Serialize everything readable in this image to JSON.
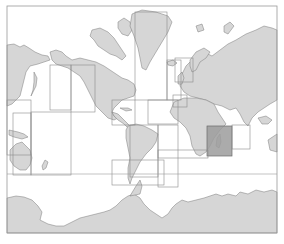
{
  "map": {
    "type": "world-chart-index",
    "projection": "mercator",
    "colors": {
      "land": "#d6d6d6",
      "coast": "#7a7a7a",
      "ocean": "#ffffff",
      "region_border": "#8a8a8a",
      "selected_region": "#9c9c9c"
    },
    "frame": {
      "x": 7,
      "y": 6,
      "w": 270,
      "h": 227
    },
    "southern_line_y": 174,
    "regions": [
      {
        "id": "north-pacific-west",
        "x": 7,
        "y": 100,
        "w": 24,
        "h": 55
      },
      {
        "id": "west-pacific",
        "x": 13,
        "y": 113,
        "w": 18,
        "h": 62
      },
      {
        "id": "north-pacific-central",
        "x": 50,
        "y": 65,
        "w": 21,
        "h": 45
      },
      {
        "id": "north-pacific-east",
        "x": 71,
        "y": 65,
        "w": 24,
        "h": 47
      },
      {
        "id": "south-pacific",
        "x": 31,
        "y": 112,
        "w": 40,
        "h": 63
      },
      {
        "id": "north-atlantic-west",
        "x": 135,
        "y": 12,
        "w": 32,
        "h": 88
      },
      {
        "id": "north-atlantic",
        "x": 167,
        "y": 60,
        "w": 14,
        "h": 40
      },
      {
        "id": "caribbean",
        "x": 112,
        "y": 100,
        "w": 23,
        "h": 25
      },
      {
        "id": "central-atlantic",
        "x": 148,
        "y": 100,
        "w": 30,
        "h": 24
      },
      {
        "id": "south-atlantic",
        "x": 158,
        "y": 125,
        "w": 20,
        "h": 62
      },
      {
        "id": "south-america-east",
        "x": 130,
        "y": 125,
        "w": 28,
        "h": 52
      },
      {
        "id": "south-america-south",
        "x": 112,
        "y": 160,
        "w": 52,
        "h": 25
      },
      {
        "id": "north-sea",
        "x": 175,
        "y": 58,
        "w": 18,
        "h": 24
      },
      {
        "id": "mediterranean-west",
        "x": 173,
        "y": 95,
        "w": 14,
        "h": 12
      },
      {
        "id": "indian-ocean-west",
        "x": 207,
        "y": 126,
        "w": 25,
        "h": 30,
        "selected": true
      },
      {
        "id": "indian-ocean-central",
        "x": 232,
        "y": 125,
        "w": 18,
        "h": 24
      },
      {
        "id": "west-africa",
        "x": 158,
        "y": 150,
        "w": 50,
        "h": 8
      }
    ],
    "selected_region_id": "indian-ocean-west"
  }
}
